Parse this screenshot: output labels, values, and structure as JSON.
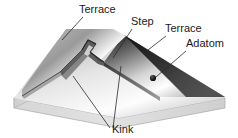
{
  "figure": {
    "kind": "crystal-surface-schematic",
    "background_color": "#ffffff",
    "labels": [
      {
        "id": "terrace-left",
        "text": "Terrace",
        "x": 79,
        "y": 13
      },
      {
        "id": "step",
        "text": "Step",
        "x": 131,
        "y": 25
      },
      {
        "id": "terrace-right",
        "text": "Terrace",
        "x": 165,
        "y": 32
      },
      {
        "id": "adatom",
        "text": "Adatom",
        "x": 186,
        "y": 47
      },
      {
        "id": "kink",
        "text": "Kink",
        "x": 112,
        "y": 133
      }
    ],
    "colors": {
      "label_text": "#1a1a1a",
      "leader_line": "#2b2b2b",
      "adatom_dot": "#111111",
      "block_side": "#c9c9c9",
      "terrace_light": "#f2f2f2",
      "terrace_dark": "#2a2a2a"
    },
    "leaders": [
      {
        "id": "terrace-left-leader",
        "points": "83,17 62,40"
      },
      {
        "id": "step-leader",
        "points": "132,29 113,58"
      },
      {
        "id": "terrace-right-leader",
        "points": "166,36 148,50"
      },
      {
        "id": "adatom-leader",
        "points": "186,51 156,77"
      },
      {
        "id": "kink-leader-a",
        "points": "110,128 73,76"
      },
      {
        "id": "kink-leader-b",
        "points": "113,128 121,66"
      }
    ],
    "adatom_marker": {
      "cx": 153,
      "cy": 78,
      "r": 3.1
    }
  }
}
